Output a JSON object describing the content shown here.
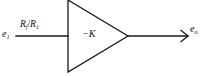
{
  "diagram": {
    "type": "block-diagram",
    "background_color": "#ffffff",
    "line_color": "#1a1a1a",
    "text_color": "#111111",
    "input_signal": {
      "symbol": "e",
      "subscript": "1",
      "label": "e₁"
    },
    "output_signal": {
      "symbol": "e",
      "subscript": "o",
      "label": "eₒ"
    },
    "path_gain": {
      "numerator": "R",
      "numerator_subscript": "f",
      "denominator": "R",
      "denominator_subscript": "1",
      "label": "R_f/R_1"
    },
    "block": {
      "shape": "triangle",
      "orientation": "right",
      "gain_label": "−K",
      "gain_sign": "−",
      "gain_symbol": "K"
    },
    "geometry": {
      "input_line": {
        "x1": 16,
        "y1": 36,
        "x2": 68,
        "y2": 36
      },
      "triangle": {
        "left_x": 68,
        "top_y": 0,
        "bottom_y": 72,
        "apex_x": 128,
        "apex_y": 36
      },
      "output_line": {
        "x1": 128,
        "y1": 36,
        "x2": 188,
        "y2": 36
      },
      "arrowhead": {
        "tip_x": 188,
        "tip_y": 36,
        "size": 7
      }
    }
  }
}
